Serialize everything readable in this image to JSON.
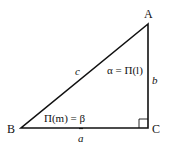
{
  "diagram": {
    "vertices": {
      "A": {
        "label": "A"
      },
      "B": {
        "label": "B"
      },
      "C": {
        "label": "C"
      }
    },
    "sides": {
      "a": {
        "label": "a"
      },
      "b": {
        "label": "b"
      },
      "c": {
        "label": "c"
      }
    },
    "angles": {
      "alpha": {
        "label": "α = Π(l)"
      },
      "beta": {
        "label": "Π(m) = β"
      }
    },
    "right_angle_at": "C",
    "colors": {
      "stroke": "#111111",
      "background": "#ffffff"
    }
  }
}
